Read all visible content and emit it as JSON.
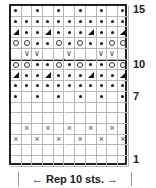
{
  "chart": {
    "columns": 11,
    "rows": 15,
    "row_labels": [
      {
        "row": 15,
        "text": "15"
      },
      {
        "row": 10,
        "text": "10"
      },
      {
        "row": 7,
        "text": "7"
      },
      {
        "row": 1,
        "text": "1"
      }
    ],
    "repeat_label": "← Rep 10 sts. →",
    "legend_symbols": {
      "dot": "purl",
      "o": "yarn over",
      "tri": "decrease",
      "v": "slip",
      "x": "cross",
      "": "knit"
    },
    "grid_rows_top_to_bottom": [
      {
        "row": 15,
        "cells": [
          "dot",
          "",
          "dot",
          "",
          "dot",
          "",
          "dot",
          "",
          "dot",
          "",
          "dot"
        ]
      },
      {
        "row": 14,
        "cells": [
          "dot",
          "dot",
          "dot",
          "dot",
          "dot",
          "dot",
          "dot",
          "dot",
          "dot",
          "dot",
          "dot"
        ]
      },
      {
        "row": 13,
        "cells": [
          "tri",
          "dot",
          "dot",
          "tri",
          "dot",
          "dot",
          "dot",
          "tri",
          "dot",
          "dot",
          "tri"
        ]
      },
      {
        "row": 12,
        "cells": [
          "o",
          "o",
          "dot",
          "dot",
          "o",
          "dot",
          "o",
          "dot",
          "dot",
          "o",
          "o"
        ]
      },
      {
        "row": 11,
        "cells": [
          "",
          "v",
          "v",
          "",
          "",
          "v",
          "",
          "",
          "v",
          "v",
          ""
        ]
      },
      {
        "row": 10,
        "cells": [
          "o",
          "o",
          "dot",
          "dot",
          "o",
          "dot",
          "o",
          "dot",
          "dot",
          "o",
          "o"
        ]
      },
      {
        "row": 9,
        "cells": [
          "tri",
          "dot",
          "dot",
          "tri",
          "dot",
          "dot",
          "dot",
          "tri",
          "dot",
          "dot",
          "tri"
        ]
      },
      {
        "row": 8,
        "cells": [
          "dot",
          "dot",
          "dot",
          "dot",
          "dot",
          "dot",
          "dot",
          "dot",
          "dot",
          "dot",
          "dot"
        ]
      },
      {
        "row": 7,
        "cells": [
          "dot",
          "",
          "dot",
          "",
          "dot",
          "",
          "dot",
          "",
          "dot",
          "",
          "dot"
        ]
      },
      {
        "row": 6,
        "cells": [
          "",
          "",
          "",
          "",
          "",
          "",
          "",
          "",
          "",
          "",
          ""
        ]
      },
      {
        "row": 5,
        "cells": [
          "",
          "",
          "",
          "",
          "",
          "",
          "",
          "",
          "",
          "",
          ""
        ]
      },
      {
        "row": 4,
        "cells": [
          "",
          "x",
          "",
          "x",
          "",
          "x",
          "",
          "x",
          "",
          "x",
          ""
        ]
      },
      {
        "row": 3,
        "cells": [
          "x",
          "",
          "x",
          "",
          "x",
          "",
          "x",
          "",
          "x",
          "",
          "x"
        ]
      },
      {
        "row": 2,
        "cells": [
          "",
          "",
          "",
          "",
          "",
          "",
          "",
          "",
          "",
          "",
          ""
        ]
      },
      {
        "row": 1,
        "cells": [
          "",
          "",
          "",
          "",
          "",
          "",
          "",
          "",
          "",
          "",
          ""
        ]
      }
    ]
  }
}
